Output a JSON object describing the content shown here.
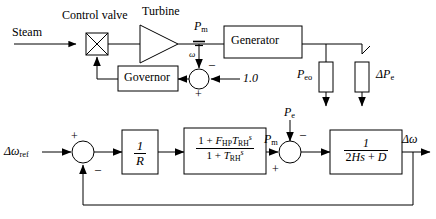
{
  "figure": {
    "stroke_color": "#000000",
    "background": "#ffffff"
  },
  "top_diagram": {
    "name": "physical-schematic",
    "labels": {
      "steam": "Steam",
      "control_valve": "Control valve",
      "turbine": "Turbine",
      "governor": "Governor",
      "generator": "Generator",
      "pm": "P",
      "pm_sub": "m",
      "omega": "ω",
      "one_point_zero": "1.0",
      "peo": "P",
      "peo_sub": "eo",
      "delta_pe": "ΔP",
      "delta_pe_sub": "e",
      "sum_minus": "–",
      "sum_plus": "+"
    }
  },
  "bottom_diagram": {
    "name": "equivalent-block-diagram",
    "labels": {
      "delta_omega_ref": "Δω",
      "delta_omega_ref_sub": "ref",
      "sum1_plus": "+",
      "sum1_minus": "–",
      "droop_num": "1",
      "droop_den": "R",
      "turbine_num_a": "1 + ",
      "turbine_num_f": "F",
      "turbine_num_f_sub": "HP",
      "turbine_num_t": "T",
      "turbine_num_t_sub": "RH",
      "turbine_num_s": "s",
      "turbine_den_a": "1 + ",
      "turbine_den_t": "T",
      "turbine_den_t_sub": "RH",
      "turbine_den_s": "s",
      "pm": "P",
      "pm_sub": "m",
      "pe": "P",
      "pe_sub": "e",
      "sum2_minus": "–",
      "sum2_plus": "+",
      "inertia_num": "1",
      "inertia_den_a": "2",
      "inertia_den_h": "H",
      "inertia_den_s": "s",
      "inertia_den_b": " + ",
      "inertia_den_d": "D",
      "delta_omega_out": "Δω"
    }
  }
}
